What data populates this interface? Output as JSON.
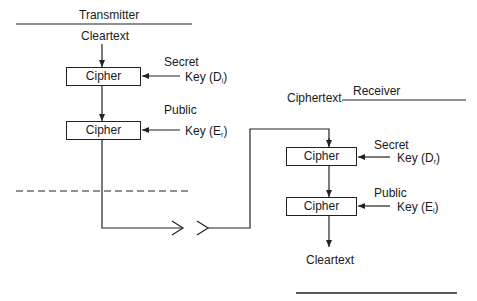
{
  "transmitter": {
    "title": "Transmitter",
    "input_label": "Cleartext",
    "cipher1": {
      "label": "Cipher",
      "key_type": "Secret",
      "key_label": "Key",
      "key_symbol": "D",
      "key_sub": "i"
    },
    "cipher2": {
      "label": "Cipher",
      "key_type": "Public",
      "key_label": "Key",
      "key_symbol": "E",
      "key_sub": "r"
    }
  },
  "receiver": {
    "title": "Receiver",
    "input_label": "Ciphertext",
    "output_label": "Cleartext",
    "cipher1": {
      "label": "Cipher",
      "key_type": "Secret",
      "key_label": "Key",
      "key_symbol": "D",
      "key_sub": "r"
    },
    "cipher2": {
      "label": "Cipher",
      "key_type": "Public",
      "key_label": "Key",
      "key_symbol": "E",
      "key_sub": "i"
    }
  },
  "colors": {
    "line": "#222222",
    "background": "#ffffff"
  }
}
